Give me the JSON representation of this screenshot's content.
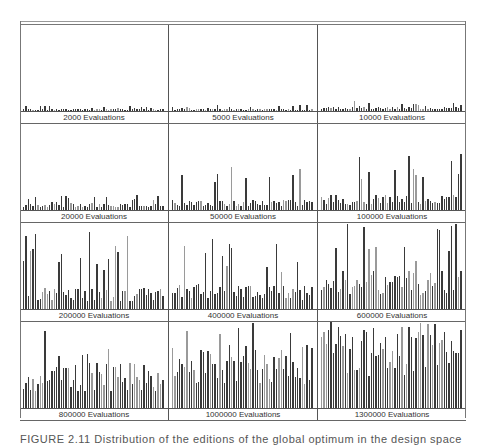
{
  "figure": {
    "caption": "FIGURE 2.11  Distribution of the editions of the global optimum in the design space"
  },
  "chart_data": {
    "type": "bar",
    "title": "",
    "layout": "3x4 grid of small-multiple bar histograms",
    "grid": false,
    "colors": {
      "bar_dark": "#3a3a3a",
      "bar_light": "#9a9a9a",
      "border": "#666666",
      "label": "#333333"
    },
    "panels": [
      {
        "label": "2000 Evaluations",
        "row": 0,
        "level": 3,
        "spike": 6,
        "seed": 1
      },
      {
        "label": "5000 Evaluations",
        "row": 0,
        "level": 3,
        "spike": 7,
        "seed": 2
      },
      {
        "label": "10000 Evaluations",
        "row": 0,
        "level": 5,
        "spike": 12,
        "seed": 3
      },
      {
        "label": "20000 Evaluations",
        "row": 1,
        "level": 8,
        "spike": 18,
        "seed": 4
      },
      {
        "label": "50000 Evaluations",
        "row": 1,
        "level": 12,
        "spike": 50,
        "seed": 5
      },
      {
        "label": "100000 Evaluations",
        "row": 1,
        "level": 18,
        "spike": 70,
        "seed": 6
      },
      {
        "label": "200000 Evaluations",
        "row": 2,
        "level": 25,
        "spike": 90,
        "seed": 7
      },
      {
        "label": "400000 Evaluations",
        "row": 2,
        "level": 30,
        "spike": 85,
        "seed": 8
      },
      {
        "label": "600000 Evaluations",
        "row": 2,
        "level": 45,
        "spike": 100,
        "seed": 9
      },
      {
        "label": "800000 Evaluations",
        "row": 3,
        "level": 55,
        "spike": 100,
        "seed": 10
      },
      {
        "label": "1000000 Evaluations",
        "row": 3,
        "level": 75,
        "spike": 100,
        "seed": 11
      },
      {
        "label": "1300000 Evaluations",
        "row": 3,
        "level": 100,
        "spike": 100,
        "seed": 12
      }
    ],
    "row_plot_heights_px": [
      86,
      86,
      86,
      86
    ],
    "bars_per_panel": 60,
    "xlabel": "",
    "ylabel": "",
    "ylim": [
      0,
      100
    ]
  }
}
